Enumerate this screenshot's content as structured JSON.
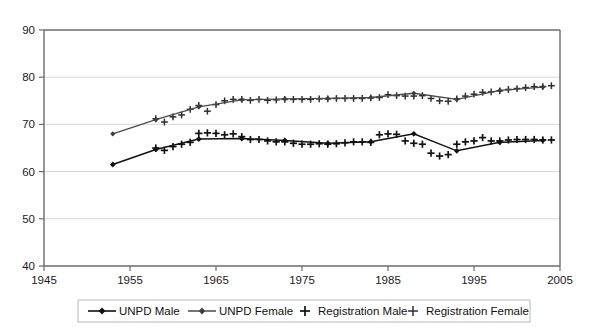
{
  "chart_data": {
    "type": "line",
    "title": "",
    "subtitle": "",
    "xlabel": "",
    "ylabel": "",
    "xlim": [
      1945,
      2005
    ],
    "ylim": [
      40,
      90
    ],
    "xticks": [
      1945,
      1955,
      1965,
      1975,
      1985,
      1995,
      2005
    ],
    "yticks": [
      40,
      50,
      60,
      70,
      80,
      90
    ],
    "grid": "horizontal",
    "legend_position": "bottom",
    "legend": [
      {
        "label": "UNPD Male",
        "marker": "line-diamond",
        "color": "#111111"
      },
      {
        "label": "UNPD Female",
        "marker": "line-diamond",
        "color": "#3d3d3d"
      },
      {
        "label": "Registration Male",
        "marker": "plus",
        "color": "#111111"
      },
      {
        "label": "Registration Female",
        "marker": "plus",
        "color": "#2e2e2e"
      }
    ],
    "series": [
      {
        "name": "UNPD Male",
        "type": "line-marker",
        "x": [
          1953,
          1958,
          1963,
          1968,
          1973,
          1978,
          1983,
          1988,
          1993,
          1998,
          2003
        ],
        "values": [
          61.5,
          64.7,
          66.9,
          67.0,
          66.6,
          66.0,
          66.3,
          68.0,
          64.4,
          66.2,
          66.6
        ]
      },
      {
        "name": "UNPD Female",
        "type": "line-marker",
        "x": [
          1953,
          1958,
          1963,
          1968,
          1973,
          1978,
          1983,
          1988,
          1993,
          1998,
          2003
        ],
        "values": [
          68.0,
          71.0,
          73.7,
          75.2,
          75.4,
          75.5,
          75.7,
          76.6,
          75.3,
          77.2,
          77.9
        ]
      },
      {
        "name": "Registration Male",
        "type": "scatter",
        "x": [
          1958,
          1959,
          1960,
          1961,
          1962,
          1963,
          1964,
          1965,
          1966,
          1967,
          1968,
          1969,
          1970,
          1971,
          1972,
          1973,
          1974,
          1975,
          1976,
          1977,
          1978,
          1979,
          1980,
          1981,
          1982,
          1983,
          1984,
          1985,
          1986,
          1987,
          1988,
          1989,
          1990,
          1991,
          1992,
          1993,
          1994,
          1995,
          1996,
          1997,
          1998,
          1999,
          2000,
          2001,
          2002,
          2003,
          2004
        ],
        "values": [
          65.0,
          64.5,
          65.3,
          65.8,
          66.2,
          68.1,
          68.2,
          68.1,
          67.8,
          68.0,
          67.4,
          66.8,
          66.8,
          66.5,
          66.3,
          66.3,
          66.0,
          65.8,
          65.8,
          65.9,
          65.8,
          65.9,
          66.1,
          66.3,
          66.3,
          66.2,
          67.8,
          68.0,
          67.9,
          66.5,
          66.0,
          65.8,
          63.9,
          63.3,
          63.6,
          65.8,
          66.3,
          66.5,
          67.2,
          66.5,
          66.5,
          66.7,
          66.8,
          66.8,
          66.8,
          66.7,
          66.7
        ]
      },
      {
        "name": "Registration Female",
        "type": "scatter",
        "x": [
          1958,
          1959,
          1960,
          1961,
          1962,
          1963,
          1964,
          1965,
          1966,
          1967,
          1968,
          1969,
          1970,
          1971,
          1972,
          1973,
          1974,
          1975,
          1976,
          1977,
          1978,
          1979,
          1980,
          1981,
          1982,
          1983,
          1984,
          1985,
          1986,
          1987,
          1988,
          1989,
          1990,
          1991,
          1992,
          1993,
          1994,
          1995,
          1996,
          1997,
          1998,
          1999,
          2000,
          2001,
          2002,
          2003,
          2004
        ],
        "values": [
          71.2,
          70.5,
          71.6,
          72.0,
          73.2,
          74.0,
          72.8,
          74.2,
          75.0,
          75.3,
          75.3,
          75.1,
          75.3,
          75.1,
          75.2,
          75.3,
          75.3,
          75.3,
          75.3,
          75.4,
          75.4,
          75.5,
          75.5,
          75.5,
          75.5,
          75.6,
          75.7,
          76.3,
          76.1,
          76.0,
          76.0,
          76.1,
          75.5,
          75.0,
          74.9,
          75.4,
          76.0,
          76.4,
          76.8,
          76.9,
          77.1,
          77.4,
          77.6,
          77.8,
          78.0,
          78.0,
          78.2
        ]
      }
    ]
  },
  "axis": {
    "ylabels": [
      "90",
      "80",
      "70",
      "60",
      "50",
      "40"
    ],
    "xlabels": [
      "1945",
      "1955",
      "1965",
      "1975",
      "1985",
      "1995",
      "2005"
    ]
  },
  "legend": {
    "item0": "UNPD Male",
    "item1": "UNPD Female",
    "item2": "Registration Male",
    "item3": "Registration Female"
  }
}
